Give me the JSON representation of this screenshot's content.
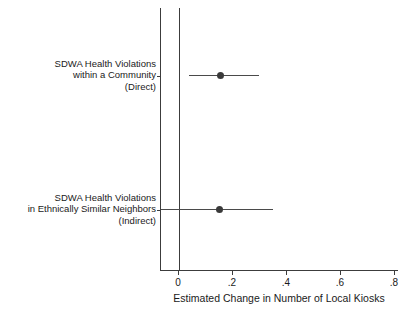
{
  "chart_data": {
    "type": "scatter",
    "subtype": "coefficient-plot",
    "title": "",
    "xlabel": "Estimated Change in Number of Local Kiosks",
    "ylabel": "",
    "xlim": [
      -0.0667,
      0.8815
    ],
    "xticks": [
      0,
      0.2,
      0.4,
      0.6,
      0.8
    ],
    "xticklabels": [
      "0",
      ".2",
      ".4",
      ".6",
      ".8"
    ],
    "grid": false,
    "legend": null,
    "reference_line": {
      "x": 0,
      "label": "0"
    },
    "categories": [
      "SDWA Health Violations within a Community (Direct)",
      "SDWA Health Violations in Ethnically Similar Neighbors (Indirect)"
    ],
    "points": [
      {
        "label_lines": [
          "SDWA Health Violations",
          "within a Community",
          "(Direct)"
        ],
        "estimate": 0.152,
        "ci_low": 0.037,
        "ci_high": 0.296,
        "ci_clipped_left": false
      },
      {
        "label_lines": [
          "SDWA Health Violations",
          "in Ethnically Similar Neighbors",
          "(Indirect)"
        ],
        "estimate": 0.15,
        "ci_low": -0.0667,
        "ci_high": 0.348,
        "ci_clipped_left": true
      }
    ],
    "colors": {
      "marker": "#3a3a3a",
      "whisker": "#4a4a4a",
      "axis": "#3c3c3c",
      "text": "#1a1a1a",
      "background": "#ffffff"
    }
  }
}
